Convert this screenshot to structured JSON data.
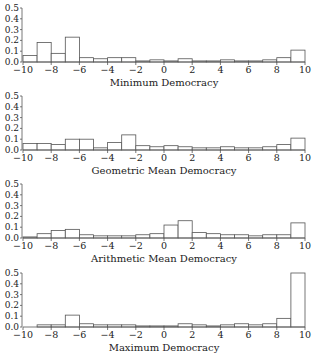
{
  "chart_data": [
    {
      "type": "bar",
      "title": "Minimum Democracy",
      "xlabel": "Minimum Democracy",
      "ylabel": "",
      "bin_edges": [
        -10,
        -9,
        -8,
        -7,
        -6,
        -5,
        -4,
        -3,
        -2,
        -1,
        0,
        1,
        2,
        3,
        4,
        5,
        6,
        7,
        8,
        9,
        10
      ],
      "values": [
        0.06,
        0.18,
        0.08,
        0.23,
        0.04,
        0.03,
        0.04,
        0.04,
        0.01,
        0.02,
        0.01,
        0.03,
        0.01,
        0.01,
        0.02,
        0.01,
        0.01,
        0.02,
        0.04,
        0.11
      ],
      "xlim": [
        -10,
        10
      ],
      "ylim": [
        0,
        0.5
      ],
      "xticks": [
        "−10",
        "−8",
        "−6",
        "−4",
        "−2",
        "0",
        "2",
        "4",
        "6",
        "8",
        "10"
      ],
      "yticks": [
        "0.0",
        "0.1",
        "0.2",
        "0.3",
        "0.4",
        "0.5"
      ],
      "grid": false
    },
    {
      "type": "bar",
      "title": "Geometric Mean Democracy",
      "xlabel": "Geometric Mean Democracy",
      "ylabel": "",
      "bin_edges": [
        -10,
        -9,
        -8,
        -7,
        -6,
        -5,
        -4,
        -3,
        -2,
        -1,
        0,
        1,
        2,
        3,
        4,
        5,
        6,
        7,
        8,
        9,
        10
      ],
      "values": [
        0.06,
        0.06,
        0.05,
        0.1,
        0.1,
        0.02,
        0.07,
        0.14,
        0.04,
        0.03,
        0.04,
        0.03,
        0.02,
        0.02,
        0.03,
        0.02,
        0.02,
        0.03,
        0.05,
        0.11
      ],
      "xlim": [
        -10,
        10
      ],
      "ylim": [
        0,
        0.5
      ],
      "xticks": [
        "−10",
        "−8",
        "−6",
        "−4",
        "−2",
        "0",
        "2",
        "4",
        "6",
        "8",
        "10"
      ],
      "yticks": [
        "0.0",
        "0.1",
        "0.2",
        "0.3",
        "0.4",
        "0.5"
      ],
      "grid": false
    },
    {
      "type": "bar",
      "title": "Arithmetic Mean Democracy",
      "xlabel": "Arithmetic Mean Democracy",
      "ylabel": "",
      "bin_edges": [
        -10,
        -9,
        -8,
        -7,
        -6,
        -5,
        -4,
        -3,
        -2,
        -1,
        0,
        1,
        2,
        3,
        4,
        5,
        6,
        7,
        8,
        9,
        10
      ],
      "values": [
        0.01,
        0.04,
        0.07,
        0.08,
        0.03,
        0.02,
        0.02,
        0.02,
        0.03,
        0.04,
        0.12,
        0.16,
        0.05,
        0.04,
        0.03,
        0.03,
        0.02,
        0.03,
        0.03,
        0.14
      ],
      "xlim": [
        -10,
        10
      ],
      "ylim": [
        0,
        0.5
      ],
      "xticks": [
        "−10",
        "−8",
        "−6",
        "−4",
        "−2",
        "0",
        "2",
        "4",
        "6",
        "8",
        "10"
      ],
      "yticks": [
        "0.0",
        "0.1",
        "0.2",
        "0.3",
        "0.4",
        "0.5"
      ],
      "grid": false
    },
    {
      "type": "bar",
      "title": "Maximum Democracy",
      "xlabel": "Maximum Democracy",
      "ylabel": "",
      "bin_edges": [
        -10,
        -9,
        -8,
        -7,
        -6,
        -5,
        -4,
        -3,
        -2,
        -1,
        0,
        1,
        2,
        3,
        4,
        5,
        6,
        7,
        8,
        9,
        10
      ],
      "values": [
        0.0,
        0.02,
        0.02,
        0.11,
        0.03,
        0.02,
        0.02,
        0.02,
        0.01,
        0.01,
        0.01,
        0.03,
        0.02,
        0.01,
        0.02,
        0.03,
        0.02,
        0.03,
        0.08,
        0.5
      ],
      "xlim": [
        -10,
        10
      ],
      "ylim": [
        0,
        0.5
      ],
      "xticks": [
        "−10",
        "−8",
        "−6",
        "−4",
        "−2",
        "0",
        "2",
        "4",
        "6",
        "8",
        "10"
      ],
      "yticks": [
        "0.0",
        "0.1",
        "0.2",
        "0.3",
        "0.4",
        "0.5"
      ],
      "grid": false
    }
  ],
  "style": {
    "bar_fill": "#ffffff",
    "bar_stroke": "#555555",
    "axis_color": "#555555",
    "text_color": "#222222"
  }
}
